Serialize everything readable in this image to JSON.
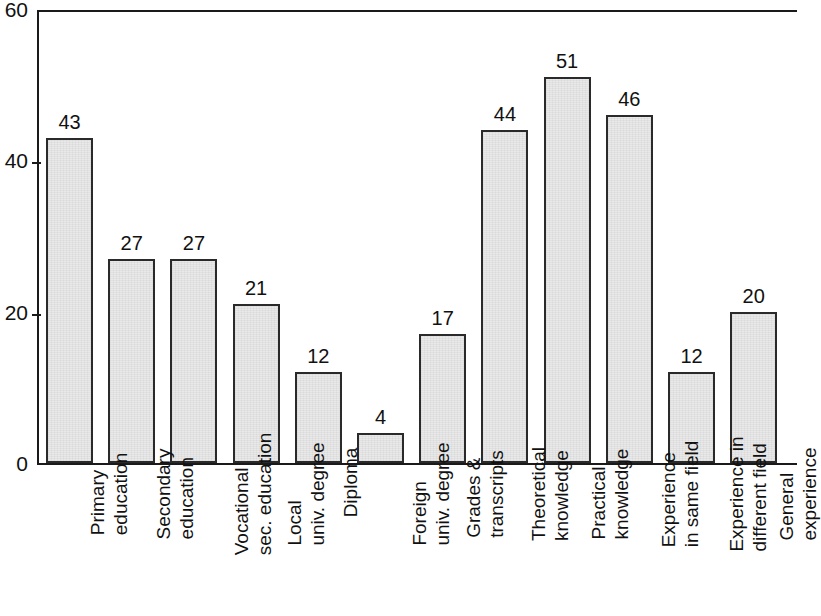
{
  "chart_data": {
    "type": "bar",
    "title": "",
    "subtitle": "",
    "xlabel": "",
    "ylabel": "",
    "ylim": [
      0,
      60
    ],
    "yticks": [
      0,
      20,
      40,
      60
    ],
    "ytick_labels": [
      "0",
      "20",
      "40",
      "60"
    ],
    "grid": false,
    "legend": null,
    "bar_fill_color": "#e9e9e9",
    "bar_border_color": "#2a2a2a",
    "axis_color": "#1a1a1a",
    "background_color": "#ffffff",
    "value_labels_shown": true,
    "categories": [
      "Primary education",
      "Secondary education",
      "Vocational sec. education",
      "Local univ. degree",
      "Diploma",
      "Foreign univ. degree",
      "Grades & transcripts",
      "Theoretical knowledge",
      "Practical knowledge",
      "Experience in same field",
      "Experience in different field",
      "General experience"
    ],
    "category_lines": [
      [
        "Primary",
        "education"
      ],
      [
        "Secondary",
        "education"
      ],
      [
        "Vocational",
        "sec. education"
      ],
      [
        "Local",
        "univ. degree"
      ],
      [
        "Diploma"
      ],
      [
        "Foreign",
        "univ. degree"
      ],
      [
        "Grades &",
        "transcripts"
      ],
      [
        "Theoretical",
        "knowledge"
      ],
      [
        "Practical",
        "knowledge"
      ],
      [
        "Experience",
        "in same field"
      ],
      [
        "Experience in",
        "different field"
      ],
      [
        "General",
        "experience"
      ]
    ],
    "values": [
      43,
      27,
      27,
      21,
      12,
      4,
      17,
      44,
      51,
      46,
      12,
      20
    ],
    "value_labels": [
      "43",
      "27",
      "27",
      "21",
      "12",
      "4",
      "17",
      "44",
      "51",
      "46",
      "12",
      "20"
    ]
  }
}
